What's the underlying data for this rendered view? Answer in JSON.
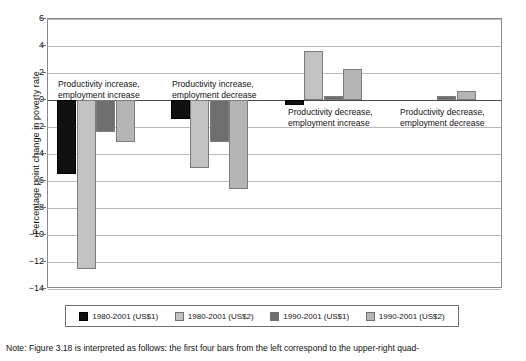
{
  "chart_data": {
    "type": "bar",
    "title": "",
    "xlabel": "",
    "ylabel": "Percentage point change in poverty rate",
    "ylim": [
      -14,
      6
    ],
    "ytick_step": 2,
    "yticks": [
      6,
      4,
      2,
      0,
      -2,
      -4,
      -6,
      -8,
      -10,
      -12,
      -14
    ],
    "grid": true,
    "legend_position": "bottom",
    "categories": [
      "Productivity increase, employment increase",
      "Productivity increase, employment decrease",
      "Productivity decrease, employment increase",
      "Productivity decrease, employment decrease"
    ],
    "series": [
      {
        "name": "1980-2001 (US$1)",
        "color": "#111111",
        "values": [
          -5.5,
          -1.4,
          -0.4,
          0.0
        ]
      },
      {
        "name": "1980-2001 (US$2)",
        "color": "#c2c2c2",
        "values": [
          -12.5,
          -5.0,
          3.6,
          0.0
        ]
      },
      {
        "name": "1990-2001 (US$1)",
        "color": "#6e6e6e",
        "values": [
          -2.4,
          -3.1,
          0.3,
          0.3
        ]
      },
      {
        "name": "1990-2001 (US$2)",
        "color": "#b5b5b5",
        "values": [
          -3.1,
          -6.6,
          2.3,
          0.7
        ]
      }
    ],
    "annotations": [
      {
        "line1": "Productivity increase,",
        "line2": "employment increase"
      },
      {
        "line1": "Productivity increase,",
        "line2": "employment decrease"
      },
      {
        "line1": "Productivity decrease,",
        "line2": "employment increase"
      },
      {
        "line1": "Productivity decrease,",
        "line2": "employment decrease"
      }
    ]
  },
  "legend": {
    "items": [
      {
        "label": "1980-2001 (US$1)"
      },
      {
        "label": "1980-2001 (US$2)"
      },
      {
        "label": "1990-2001 (US$1)"
      },
      {
        "label": "1990-2001 (US$2)"
      }
    ]
  },
  "note": {
    "text": "Note: Figure 3.18 is interpreted as follows: the first four bars from the left correspond to the upper-right quad-"
  },
  "colors": {
    "series_1980_us1": "#111111",
    "series_1980_us2": "#c2c2c2",
    "series_1990_us1": "#6e6e6e",
    "series_1990_us2": "#b5b5b5",
    "grid": "#b9b9b9",
    "axis": "#8a8a8a"
  }
}
